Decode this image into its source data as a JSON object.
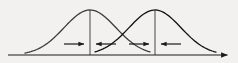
{
  "figure": {
    "type": "statistical-diagram",
    "width": 238,
    "height": 63,
    "background_color": "#f2f1ef",
    "stroke_color": "#1a1a1a",
    "curve_stroke_width": 1.3,
    "axis_stroke_width": 1.2,
    "vline_stroke_width": 1.1,
    "arrow_stroke_width": 1.2
  },
  "axis": {
    "label": "horizontal-axis",
    "y": 55,
    "x_start": 8,
    "x_end": 232,
    "has_end_arrowhead": true,
    "arrowhead_size": 4.5
  },
  "curves": [
    {
      "name": "left-normal-curve",
      "peak_x": 90,
      "peak_y": 10,
      "baseline_y": 55,
      "tail_left_x": 25,
      "tail_right_x": 150,
      "spread": 26,
      "stroke": "#3b3b3b"
    },
    {
      "name": "right-normal-curve",
      "peak_x": 155,
      "peak_y": 10,
      "baseline_y": 55,
      "tail_left_x": 95,
      "tail_right_x": 216,
      "spread": 26,
      "stroke": "#111111"
    }
  ],
  "mean_lines": [
    {
      "name": "left-mean-line",
      "x": 90,
      "y_top": 10,
      "y_bottom": 55
    },
    {
      "name": "right-mean-line",
      "x": 155,
      "y_top": 10,
      "y_bottom": 55
    }
  ],
  "arrows": [
    {
      "name": "arrow-right-toward-left-mean",
      "direction": "right",
      "y": 44,
      "tail_x": 64,
      "head_x": 86
    },
    {
      "name": "arrow-left-toward-left-mean",
      "direction": "left",
      "y": 44,
      "tail_x": 116,
      "head_x": 94
    },
    {
      "name": "arrow-right-toward-right-mean",
      "direction": "right",
      "y": 44,
      "tail_x": 129,
      "head_x": 151
    },
    {
      "name": "arrow-left-toward-right-mean",
      "direction": "left",
      "y": 44,
      "tail_x": 181,
      "head_x": 159
    }
  ],
  "crossing_point": {
    "name": "curve-intersection",
    "x": 123,
    "y": 42
  }
}
